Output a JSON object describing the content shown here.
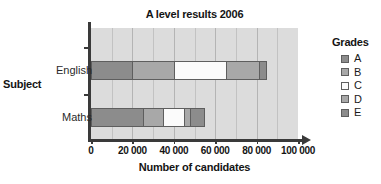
{
  "chart_data": {
    "type": "bar",
    "orientation": "horizontal",
    "stacked": true,
    "title": "A level results 2006",
    "xlabel": "Number of candidates",
    "ylabel": "Subject",
    "categories": [
      "English",
      "Maths"
    ],
    "xlim": [
      0,
      100000
    ],
    "xticks": [
      0,
      20000,
      40000,
      60000,
      80000,
      100000
    ],
    "xtick_labels": [
      "0",
      "20 000",
      "40 000",
      "60 000",
      "80 000",
      "100 000"
    ],
    "gridline_interval": 10000,
    "grid": true,
    "legend_title": "Grades",
    "legend_position": "right",
    "series": [
      {
        "name": "A",
        "color": "#8c8c8c",
        "values": [
          20000,
          25000
        ]
      },
      {
        "name": "B",
        "color": "#a8a8a8",
        "values": [
          20000,
          10000
        ]
      },
      {
        "name": "C",
        "color": "#fbfbfb",
        "values": [
          25000,
          10000
        ]
      },
      {
        "name": "D",
        "color": "#a8a8a8",
        "values": [
          16000,
          3000
        ]
      },
      {
        "name": "E",
        "color": "#8c8c8c",
        "values": [
          4000,
          7000
        ]
      }
    ],
    "totals": [
      85000,
      55000
    ],
    "plot_background": "#dcdcdc"
  },
  "legend": {
    "title": "Grades",
    "items": [
      {
        "label": "A",
        "color": "#8c8c8c"
      },
      {
        "label": "B",
        "color": "#a8a8a8"
      },
      {
        "label": "C",
        "color": "#fbfbfb"
      },
      {
        "label": "D",
        "color": "#a8a8a8"
      },
      {
        "label": "E",
        "color": "#8c8c8c"
      }
    ]
  }
}
